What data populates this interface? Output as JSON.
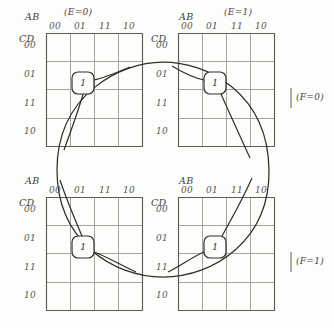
{
  "figure": {
    "type": "karnaugh-map-set",
    "grid_line_color": "#8c8c88",
    "border_color": "#55554f",
    "curve_color": "#33332f",
    "text_color": "#3f3f3d"
  },
  "maps": [
    {
      "id": "map-e0-f0",
      "position": "top-left",
      "col_var": "AB",
      "row_var": "CD",
      "col_labels": [
        "00",
        "01",
        "11",
        "10"
      ],
      "row_labels": [
        "00",
        "01",
        "11",
        "10"
      ],
      "title": "(E=0)",
      "side_title": "",
      "minterms": [
        {
          "col": "01",
          "row": "01",
          "value": "1"
        }
      ]
    },
    {
      "id": "map-e1-f0",
      "position": "top-right",
      "col_var": "AB",
      "row_var": "CD",
      "col_labels": [
        "00",
        "01",
        "11",
        "10"
      ],
      "row_labels": [
        "00",
        "01",
        "11",
        "10"
      ],
      "title": "(E=1)",
      "side_title": "(F=0)",
      "minterms": [
        {
          "col": "01",
          "row": "01",
          "value": "1"
        }
      ]
    },
    {
      "id": "map-e0-f1",
      "position": "bottom-left",
      "col_var": "AB",
      "row_var": "CD",
      "col_labels": [
        "00",
        "01",
        "11",
        "10"
      ],
      "row_labels": [
        "00",
        "01",
        "11",
        "10"
      ],
      "title": "",
      "side_title": "",
      "minterms": [
        {
          "col": "01",
          "row": "01",
          "value": "1"
        }
      ]
    },
    {
      "id": "map-e1-f1",
      "position": "bottom-right",
      "col_var": "AB",
      "row_var": "CD",
      "col_labels": [
        "00",
        "01",
        "11",
        "10"
      ],
      "row_labels": [
        "00",
        "01",
        "11",
        "10"
      ],
      "title": "",
      "side_title": "(F=1)",
      "minterms": [
        {
          "col": "01",
          "row": "01",
          "value": "1"
        }
      ]
    }
  ],
  "labels": {
    "ab": "AB",
    "cd": "CD",
    "e0": "(E=0)",
    "e1": "(E=1)",
    "f0": "(F=0)",
    "f1": "(F=1)",
    "b00": "00",
    "b01": "01",
    "b11": "11",
    "b10": "10",
    "one": "1"
  }
}
